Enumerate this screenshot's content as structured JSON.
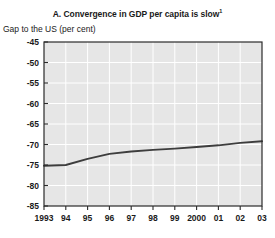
{
  "chart_data": {
    "type": "line",
    "title": "A. Convergence in GDP per capita is slow",
    "title_superscript": "1",
    "ylabel": "Gap to the US (per cent)",
    "xlabel": "",
    "ylim": [
      -85,
      -45
    ],
    "ytick_labels": [
      "-45",
      "-50",
      "-55",
      "-60",
      "-65",
      "-70",
      "-75",
      "-80",
      "-85"
    ],
    "ytick_values": [
      -45,
      -50,
      -55,
      -60,
      -65,
      -70,
      -75,
      -80,
      -85
    ],
    "x": [
      1993,
      1994,
      1995,
      1996,
      1997,
      1998,
      1999,
      2000,
      2001,
      2002,
      2003
    ],
    "xtick_labels": [
      "1993",
      "94",
      "95",
      "96",
      "97",
      "98",
      "99",
      "2000",
      "01",
      "02",
      "03"
    ],
    "series": [
      {
        "name": "Gap to the US",
        "values": [
          -75.2,
          -75.0,
          -73.5,
          -72.3,
          -71.7,
          -71.3,
          -71.0,
          -70.6,
          -70.2,
          -69.6,
          -69.2
        ]
      }
    ],
    "grid": true,
    "legend_position": "none",
    "colors": {
      "line": "#3d3d3d",
      "plot_background": "#e6e6e6",
      "gridline": "#ffffff",
      "axis": "#2b2b2b",
      "text": "#1a1a1a",
      "page_background": "#ffffff"
    }
  }
}
